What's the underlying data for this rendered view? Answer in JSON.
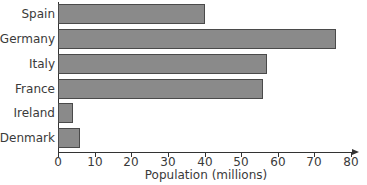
{
  "chart_data": {
    "type": "bar",
    "orientation": "horizontal",
    "title": "",
    "categories": [
      "Spain",
      "Germany",
      "Italy",
      "France",
      "Ireland",
      "Denmark"
    ],
    "values": [
      40,
      76,
      57,
      56,
      4,
      6
    ],
    "xlabel": "Population (millions)",
    "ylabel": "",
    "xlim": [
      0,
      80
    ],
    "xticks": [
      0,
      10,
      20,
      30,
      40,
      50,
      60,
      70,
      80
    ],
    "grid": false,
    "legend": null,
    "colors": {
      "bar_fill": "#8a8a8a",
      "bar_edge": "#4a4a4a",
      "axis": "#333333"
    }
  }
}
